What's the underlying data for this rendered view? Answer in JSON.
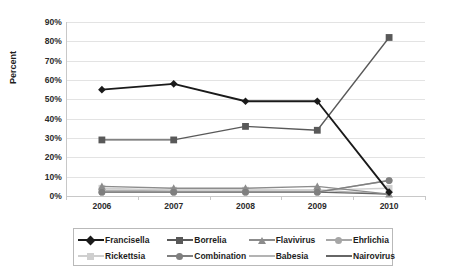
{
  "chart_data": {
    "type": "line",
    "title": "",
    "subtitle": "",
    "xlabel": "",
    "ylabel": "Percent",
    "categories": [
      "2006",
      "2007",
      "2008",
      "2009",
      "2010"
    ],
    "x": [
      2006,
      2007,
      2008,
      2009,
      2010
    ],
    "ylim": [
      0,
      90
    ],
    "ytick_labels": [
      "0%",
      "10%",
      "20%",
      "30%",
      "40%",
      "50%",
      "60%",
      "70%",
      "80%",
      "90%"
    ],
    "ytick_values": [
      0,
      10,
      20,
      30,
      40,
      50,
      60,
      70,
      80,
      90
    ],
    "grid": "horizontal",
    "legend_position": "bottom",
    "legend_columns": 4,
    "series": [
      {
        "name": "Francisella",
        "marker": "diamond",
        "color": "#1a1a1a",
        "values": [
          55,
          58,
          49,
          49,
          2
        ]
      },
      {
        "name": "Borrelia",
        "marker": "square",
        "color": "#595959",
        "values": [
          29,
          29,
          36,
          34,
          82
        ]
      },
      {
        "name": "Flavivirus",
        "marker": "triangle",
        "color": "#8c8c8c",
        "values": [
          5,
          4,
          4,
          5,
          1
        ]
      },
      {
        "name": "Ehrlichia",
        "marker": "circle",
        "color": "#a6a6a6",
        "values": [
          2,
          2,
          2,
          2,
          8
        ]
      },
      {
        "name": "Rickettsia",
        "marker": "square",
        "color": "#cfcfcf",
        "values": [
          4,
          3,
          3,
          3,
          4
        ]
      },
      {
        "name": "Combination",
        "marker": "circle",
        "color": "#7f7f7f",
        "values": [
          2,
          2,
          2,
          2,
          8
        ]
      },
      {
        "name": "Babesia",
        "marker": "none",
        "color": "#b3b3b3",
        "values": [
          3,
          3,
          3,
          3,
          1
        ]
      },
      {
        "name": "Nairovirus",
        "marker": "none",
        "color": "#666666",
        "values": [
          2,
          2,
          2,
          2,
          1
        ]
      }
    ]
  },
  "axis": {
    "y_title": "Percent"
  }
}
